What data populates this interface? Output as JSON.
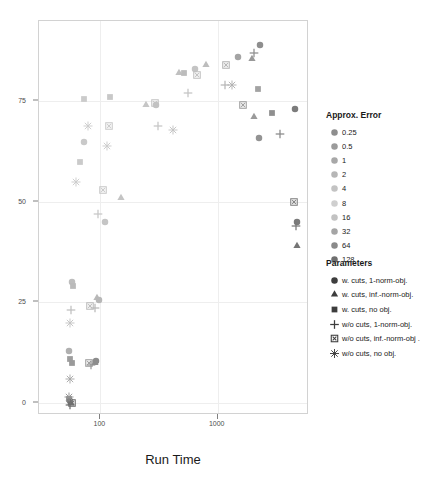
{
  "chart_data": {
    "type": "scatter",
    "title": "",
    "xlabel": "Run Time",
    "ylabel": "",
    "xscale": "log",
    "yscale": "linear",
    "xlim": [
      30,
      6000
    ],
    "ylim": [
      -3,
      95
    ],
    "grid": true,
    "x_ticks": [
      {
        "value": 100,
        "label": "100"
      },
      {
        "value": 1000,
        "label": "1000"
      }
    ],
    "y_ticks": [
      {
        "value": 0,
        "label": "0"
      },
      {
        "value": 25,
        "label": "25"
      },
      {
        "value": 50,
        "label": "50"
      },
      {
        "value": 75,
        "label": "75"
      }
    ],
    "color_legend": {
      "title": "Approx. Error",
      "entries": [
        {
          "label": "0.25",
          "color": "#8e8e8e"
        },
        {
          "label": "0.5",
          "color": "#9b9b9b"
        },
        {
          "label": "1",
          "color": "#a8a8a8"
        },
        {
          "label": "2",
          "color": "#b6b6b6"
        },
        {
          "label": "4",
          "color": "#c3c3c3"
        },
        {
          "label": "8",
          "color": "#cfcfcf"
        },
        {
          "label": "16",
          "color": "#c2c2c2"
        },
        {
          "label": "32",
          "color": "#a5a5a5"
        },
        {
          "label": "64",
          "color": "#8a8a8a"
        },
        {
          "label": "128",
          "color": "#6f6f6f"
        }
      ]
    },
    "shape_legend": {
      "title": "Parameters",
      "entries": [
        {
          "label": "w. cuts, 1-norm-obj.",
          "shape": "circle"
        },
        {
          "label": "w. cuts, inf.-norm-obj.",
          "shape": "triangle"
        },
        {
          "label": "w. cuts, no obj.",
          "shape": "square"
        },
        {
          "label": "w/o cuts, 1-norm-obj.",
          "shape": "plus"
        },
        {
          "label": "w/o cuts, inf.-norm-obj .",
          "shape": "boxed-x"
        },
        {
          "label": "w/o cuts, no obj.",
          "shape": "asterisk"
        }
      ]
    },
    "points": [
      {
        "x": 2300,
        "y": 89,
        "shape": "circle",
        "color": "#8e8e8e"
      },
      {
        "x": 2050,
        "y": 87,
        "shape": "plus",
        "color": "#8e8e8e"
      },
      {
        "x": 1950,
        "y": 85.5,
        "shape": "triangle",
        "color": "#999999"
      },
      {
        "x": 1500,
        "y": 86,
        "shape": "circle",
        "color": "#a4a4a4"
      },
      {
        "x": 1180,
        "y": 84,
        "shape": "boxed-x",
        "color": "#b3b3b3"
      },
      {
        "x": 800,
        "y": 84,
        "shape": "triangle",
        "color": "#bdbdbd"
      },
      {
        "x": 470,
        "y": 82,
        "shape": "triangle",
        "color": "#c0c0c0"
      },
      {
        "x": 520,
        "y": 82,
        "shape": "square",
        "color": "#bcbcbc"
      },
      {
        "x": 640,
        "y": 83,
        "shape": "circle",
        "color": "#c4c4c4"
      },
      {
        "x": 660,
        "y": 81.5,
        "shape": "boxed-x",
        "color": "#c0c0c0"
      },
      {
        "x": 1150,
        "y": 79,
        "shape": "plus",
        "color": "#b8b8b8"
      },
      {
        "x": 1330,
        "y": 79,
        "shape": "asterisk",
        "color": "#b0b0b0"
      },
      {
        "x": 2200,
        "y": 78,
        "shape": "square",
        "color": "#a3a3a3"
      },
      {
        "x": 560,
        "y": 77,
        "shape": "plus",
        "color": "#c5c5c5"
      },
      {
        "x": 120,
        "y": 76,
        "shape": "square",
        "color": "#c8c8c8"
      },
      {
        "x": 72,
        "y": 75.5,
        "shape": "square",
        "color": "#cbcbcb"
      },
      {
        "x": 245,
        "y": 74,
        "shape": "triangle",
        "color": "#c6c6c6"
      },
      {
        "x": 290,
        "y": 74.5,
        "shape": "boxed-x",
        "color": "#c4c4c4"
      },
      {
        "x": 300,
        "y": 74,
        "shape": "circle",
        "color": "#c2c2c2"
      },
      {
        "x": 1650,
        "y": 74,
        "shape": "boxed-x",
        "color": "#9c9c9c"
      },
      {
        "x": 2050,
        "y": 71,
        "shape": "triangle",
        "color": "#9a9a9a"
      },
      {
        "x": 2900,
        "y": 72,
        "shape": "square",
        "color": "#8f8f8f"
      },
      {
        "x": 78,
        "y": 69,
        "shape": "asterisk",
        "color": "#cccccc"
      },
      {
        "x": 118,
        "y": 69,
        "shape": "boxed-x",
        "color": "#cacaca"
      },
      {
        "x": 310,
        "y": 69,
        "shape": "plus",
        "color": "#c6c6c6"
      },
      {
        "x": 420,
        "y": 68,
        "shape": "asterisk",
        "color": "#c3c3c3"
      },
      {
        "x": 4600,
        "y": 73,
        "shape": "circle",
        "color": "#7c7c7c"
      },
      {
        "x": 2250,
        "y": 66,
        "shape": "circle",
        "color": "#939393"
      },
      {
        "x": 3400,
        "y": 67,
        "shape": "plus",
        "color": "#8a8a8a"
      },
      {
        "x": 73,
        "y": 65,
        "shape": "circle",
        "color": "#c9c9c9"
      },
      {
        "x": 115,
        "y": 64,
        "shape": "asterisk",
        "color": "#cbcbcb"
      },
      {
        "x": 67,
        "y": 60,
        "shape": "square",
        "color": "#cacaca"
      },
      {
        "x": 62,
        "y": 55,
        "shape": "asterisk",
        "color": "#cccccc"
      },
      {
        "x": 105,
        "y": 53,
        "shape": "boxed-x",
        "color": "#c8c8c8"
      },
      {
        "x": 150,
        "y": 51,
        "shape": "triangle",
        "color": "#c4c4c4"
      },
      {
        "x": 4500,
        "y": 50,
        "shape": "boxed-x",
        "color": "#808080"
      },
      {
        "x": 95,
        "y": 47,
        "shape": "plus",
        "color": "#c7c7c7"
      },
      {
        "x": 110,
        "y": 45,
        "shape": "circle",
        "color": "#c5c5c5"
      },
      {
        "x": 4700,
        "y": 45,
        "shape": "circle",
        "color": "#7a7a7a"
      },
      {
        "x": 4650,
        "y": 44,
        "shape": "plus",
        "color": "#787878"
      },
      {
        "x": 4700,
        "y": 39,
        "shape": "triangle",
        "color": "#757575"
      },
      {
        "x": 57,
        "y": 30,
        "shape": "circle",
        "color": "#bdbdbd"
      },
      {
        "x": 58,
        "y": 29,
        "shape": "square",
        "color": "#bababa"
      },
      {
        "x": 93,
        "y": 26,
        "shape": "triangle",
        "color": "#b9b9b9"
      },
      {
        "x": 98,
        "y": 25.5,
        "shape": "circle",
        "color": "#b7b7b7"
      },
      {
        "x": 56,
        "y": 23,
        "shape": "plus",
        "color": "#c0c0c0"
      },
      {
        "x": 82,
        "y": 24,
        "shape": "boxed-x",
        "color": "#bcbcbc"
      },
      {
        "x": 90,
        "y": 23.5,
        "shape": "plus",
        "color": "#bababa"
      },
      {
        "x": 55,
        "y": 20,
        "shape": "asterisk",
        "color": "#c3c3c3"
      },
      {
        "x": 54,
        "y": 13,
        "shape": "circle",
        "color": "#b0b0b0"
      },
      {
        "x": 55,
        "y": 11,
        "shape": "square",
        "color": "#9e9e9e"
      },
      {
        "x": 57,
        "y": 10,
        "shape": "square",
        "color": "#9a9a9a"
      },
      {
        "x": 80,
        "y": 10,
        "shape": "boxed-x",
        "color": "#9c9c9c"
      },
      {
        "x": 84,
        "y": 9.5,
        "shape": "plus",
        "color": "#999999"
      },
      {
        "x": 90,
        "y": 10,
        "shape": "triangle",
        "color": "#8f8f8f"
      },
      {
        "x": 92,
        "y": 10.5,
        "shape": "circle",
        "color": "#8c8c8c"
      },
      {
        "x": 55,
        "y": 6,
        "shape": "asterisk",
        "color": "#a8a8a8"
      },
      {
        "x": 54,
        "y": 1,
        "shape": "square",
        "color": "#8a8a8a"
      },
      {
        "x": 55,
        "y": 0.5,
        "shape": "circle",
        "color": "#808080"
      },
      {
        "x": 56,
        "y": 0,
        "shape": "triangle",
        "color": "#787878"
      },
      {
        "x": 55,
        "y": -0.5,
        "shape": "plus",
        "color": "#707070"
      },
      {
        "x": 57,
        "y": 0,
        "shape": "boxed-x",
        "color": "#6e6e6e"
      },
      {
        "x": 54,
        "y": 1.5,
        "shape": "asterisk",
        "color": "#949494"
      }
    ]
  }
}
